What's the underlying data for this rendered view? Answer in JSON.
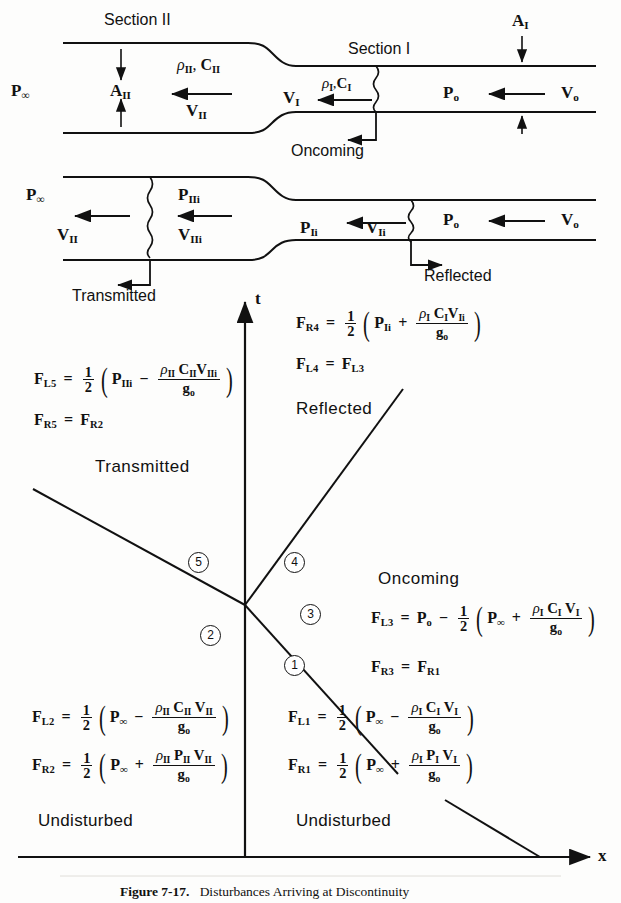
{
  "figure": {
    "number": "Figure 7-17.",
    "title": "Disturbances Arriving at Discontinuity"
  },
  "duct_top": {
    "section_ii_label": "Section II",
    "section_i_label": "Section I",
    "p_infinity": "P∞",
    "a_ii": "A_II",
    "a_i": "A_I",
    "v_ii": "V_II",
    "v_i": "V_I",
    "v_o": "V_o",
    "p_o": "P_o",
    "props_ii": "ρ_II , C_II",
    "props_i": "ρ_I , C_I",
    "oncoming_label": "Oncoming"
  },
  "duct_bottom": {
    "p_infinity": "P∞",
    "p_ii_i": "P_IIi",
    "v_ii": "V_II",
    "v_ii_i": "V_IIi",
    "p_i_i": "P_Ii",
    "v_i_i": "V_Ii",
    "p_o": "P_o",
    "v_o": "V_o",
    "transmitted_label": "Transmitted",
    "reflected_label": "Reflected"
  },
  "xt_diagram": {
    "axis_t": "t",
    "axis_x": "x",
    "region_transmitted": "Transmitted",
    "region_reflected": "Reflected",
    "region_oncoming": "Oncoming",
    "region_undisturbed_left": "Undisturbed",
    "region_undisturbed_right": "Undisturbed",
    "circled_numbers": [
      "1",
      "2",
      "3",
      "4",
      "5"
    ]
  },
  "formulas": {
    "f_l5": {
      "lhs": "F_L5",
      "eq": "=",
      "coef_num": "1",
      "coef_den": "2",
      "term1": "P_IIi",
      "op": "−",
      "frac_num": "ρ_II C_II V_IIi",
      "frac_den": "g_o"
    },
    "f_r5": {
      "lhs": "F_R5",
      "eq": "=",
      "rhs": "F_R2"
    },
    "f_r4": {
      "lhs": "F_R4",
      "eq": "=",
      "coef_num": "1",
      "coef_den": "2",
      "term1": "P_Ii",
      "op": "+",
      "frac_num": "ρ_I C_I V_Ii",
      "frac_den": "g_o"
    },
    "f_l4": {
      "lhs": "F_L4",
      "eq": "=",
      "rhs": "F_L3"
    },
    "f_l3": {
      "lhs": "F_L3",
      "eq": "=",
      "lead": "P_o",
      "lead_op": "−",
      "coef_num": "1",
      "coef_den": "2",
      "term1": "P∞",
      "op": "+",
      "frac_num": "ρ_I C_I V_I",
      "frac_den": "g_o"
    },
    "f_r3": {
      "lhs": "F_R3",
      "eq": "=",
      "rhs": "F_R1"
    },
    "f_l2": {
      "lhs": "F_L2",
      "eq": "=",
      "coef_num": "1",
      "coef_den": "2",
      "term1": "P∞",
      "op": "−",
      "frac_num": "ρ_II C_II V_II",
      "frac_den": "g_o"
    },
    "f_r2": {
      "lhs": "F_R2",
      "eq": "=",
      "coef_num": "1",
      "coef_den": "2",
      "term1": "P∞",
      "op": "+",
      "frac_num": "ρ_II P_II V_II",
      "frac_den": "g_o"
    },
    "f_l1": {
      "lhs": "F_L1",
      "eq": "=",
      "coef_num": "1",
      "coef_den": "2",
      "term1": "P∞",
      "op": "−",
      "frac_num": "ρ_I C_I V_I",
      "frac_den": "g_o"
    },
    "f_r1": {
      "lhs": "F_R1",
      "eq": "=",
      "coef_num": "1",
      "coef_den": "2",
      "term1": "P∞",
      "op": "+",
      "frac_num": "ρ_I P_I V_I",
      "frac_den": "g_o"
    }
  }
}
